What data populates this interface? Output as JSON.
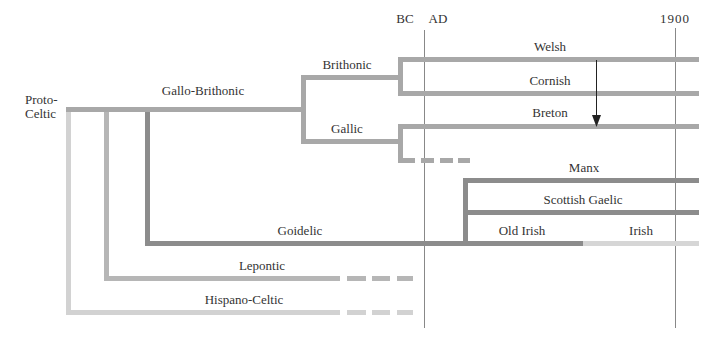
{
  "timeline": {
    "bc_label": "BC",
    "ad_label": "AD",
    "year_label": "1900"
  },
  "colors": {
    "brithonic": "#a8a8a8",
    "goidelic": "#8c8c8c",
    "lepontic": "#b6b6b6",
    "hispano": "#d2d2d2",
    "irish": "#d6d6d6",
    "axis": "#888888"
  },
  "nodes": {
    "root": "Proto-Celtic",
    "root_line1": "Proto-",
    "root_line2": "Celtic",
    "gallo_brithonic": "Gallo-Brithonic",
    "brithonic": "Brithonic",
    "gallic": "Gallic",
    "welsh": "Welsh",
    "cornish": "Cornish",
    "breton": "Breton",
    "goidelic": "Goidelic",
    "manx": "Manx",
    "scottish_gaelic": "Scottish Gaelic",
    "old_irish": "Old Irish",
    "irish": "Irish",
    "lepontic": "Lepontic",
    "hispano_celtic": "Hispano-Celtic"
  }
}
